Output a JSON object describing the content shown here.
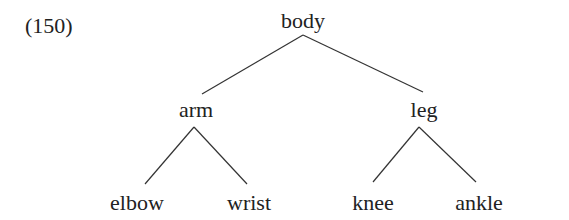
{
  "example_number": "(150)",
  "tree": {
    "root": {
      "id": "body",
      "label": "body",
      "x": 303,
      "y": 28
    },
    "nodes": [
      {
        "id": "arm",
        "label": "arm",
        "x": 196,
        "y": 117,
        "parent": "body"
      },
      {
        "id": "leg",
        "label": "leg",
        "x": 424,
        "y": 117,
        "parent": "body"
      },
      {
        "id": "elbow",
        "label": "elbow",
        "x": 137,
        "y": 210,
        "parent": "arm"
      },
      {
        "id": "wrist",
        "label": "wrist",
        "x": 249,
        "y": 210,
        "parent": "arm"
      },
      {
        "id": "knee",
        "label": "knee",
        "x": 373,
        "y": 210,
        "parent": "leg"
      },
      {
        "id": "ankle",
        "label": "ankle",
        "x": 479,
        "y": 210,
        "parent": "leg"
      }
    ],
    "edges": [
      {
        "from": "body",
        "to": "arm",
        "x1": 303,
        "y1": 35,
        "x2": 202,
        "y2": 94
      },
      {
        "from": "body",
        "to": "leg",
        "x1": 303,
        "y1": 35,
        "x2": 423,
        "y2": 92
      },
      {
        "from": "arm",
        "to": "elbow",
        "x1": 194,
        "y1": 127,
        "x2": 145,
        "y2": 184
      },
      {
        "from": "arm",
        "to": "wrist",
        "x1": 194,
        "y1": 127,
        "x2": 247,
        "y2": 184
      },
      {
        "from": "leg",
        "to": "knee",
        "x1": 419,
        "y1": 127,
        "x2": 373,
        "y2": 182
      },
      {
        "from": "leg",
        "to": "ankle",
        "x1": 419,
        "y1": 127,
        "x2": 476,
        "y2": 182
      }
    ]
  },
  "colors": {
    "text": "#222222",
    "line": "#333333",
    "background": "#ffffff"
  }
}
